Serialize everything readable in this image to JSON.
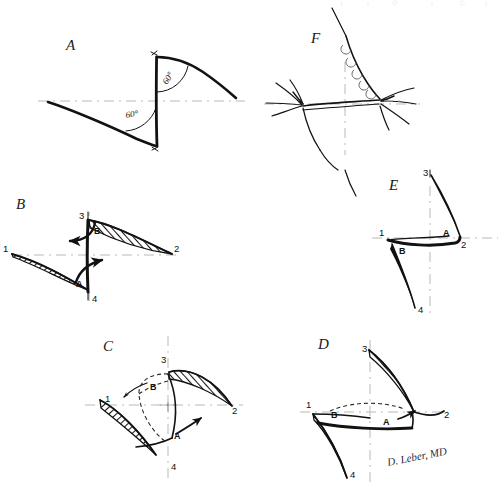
{
  "figure": {
    "background_color": "#ffffff",
    "ink_color": "#121212",
    "axis_color": "#b9b9b9",
    "signature": "D. Leber, MD",
    "width": 502,
    "height": 493
  },
  "panels": [
    {
      "id": "A",
      "letter": "A",
      "caption": "Z-plasty design with 60 degree limbs",
      "angles": [
        "60°",
        "60°"
      ],
      "point_labels": [],
      "flap_labels": []
    },
    {
      "id": "B",
      "letter": "B",
      "caption": "Flaps incised and elevated with transposition arrows",
      "angles": [],
      "point_labels": [
        "1",
        "2",
        "3",
        "4"
      ],
      "flap_labels": [
        "A",
        "B"
      ]
    },
    {
      "id": "C",
      "letter": "C",
      "caption": "Flaps rotating toward new positions",
      "angles": [],
      "point_labels": [
        "1",
        "2",
        "3",
        "4"
      ],
      "flap_labels": [
        "A",
        "B"
      ]
    },
    {
      "id": "D",
      "letter": "D",
      "caption": "Flaps transposed into final position",
      "angles": [],
      "point_labels": [
        "1",
        "2",
        "3",
        "4"
      ],
      "flap_labels": [
        "A",
        "B"
      ]
    },
    {
      "id": "E",
      "letter": "E",
      "caption": "Resulting central limb reorientation",
      "angles": [],
      "point_labels": [
        "1",
        "2",
        "3",
        "4"
      ],
      "flap_labels": [
        "A",
        "B"
      ]
    },
    {
      "id": "F",
      "letter": "F",
      "caption": "Completed closure with interrupted sutures",
      "angles": [],
      "point_labels": [],
      "flap_labels": []
    }
  ],
  "angle_value": "60°"
}
